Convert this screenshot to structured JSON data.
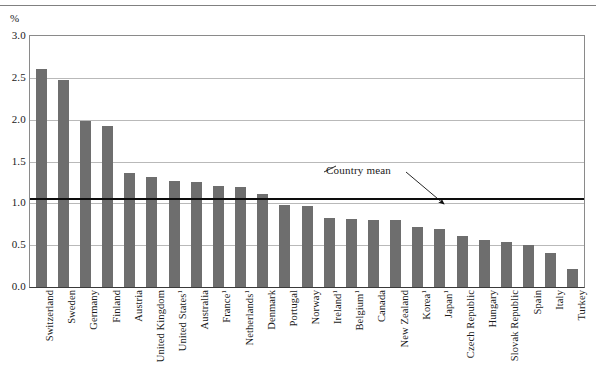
{
  "chart_data": {
    "type": "bar",
    "title": "",
    "subtitle": "",
    "unit_label": "%",
    "xlabel": "",
    "ylabel": "%",
    "ylim": [
      0.0,
      3.0
    ],
    "ytick_labels": [
      "3.0",
      "2.5",
      "2.0",
      "1.5",
      "1.0",
      "0.5",
      "0.0"
    ],
    "ytick_values": [
      3.0,
      2.5,
      2.0,
      1.5,
      1.0,
      0.5,
      0.0
    ],
    "grid": true,
    "legend": "none",
    "bar_color": "#6e6e6e",
    "mean_line_color": "#0d0d0d",
    "gridline_color": "#b9b9b9",
    "axis_color": "#8a8a8a",
    "categories": [
      "Switzerland",
      "Sweden",
      "Germany",
      "Finland",
      "Austria",
      "United Kingdom",
      "United States",
      "Australia",
      "France",
      "Netherlands",
      "Denmark",
      "Portugal",
      "Norway",
      "Ireland",
      "Belgium",
      "Canada",
      "New Zealand",
      "Korea",
      "Japan",
      "Czech Republic",
      "Hungary",
      "Slovak Republic",
      "Spain",
      "Italy",
      "Turkey"
    ],
    "category_footnotes": [
      "",
      "",
      "",
      "",
      "",
      "",
      "1",
      "",
      "1",
      "1",
      "",
      "",
      "",
      "1",
      "1",
      "",
      "",
      "1",
      "1",
      "",
      "",
      "",
      "",
      "",
      ""
    ],
    "values": [
      2.61,
      2.47,
      1.99,
      1.93,
      1.36,
      1.32,
      1.27,
      1.25,
      1.21,
      1.2,
      1.11,
      0.98,
      0.97,
      0.82,
      0.81,
      0.8,
      0.8,
      0.72,
      0.69,
      0.61,
      0.56,
      0.54,
      0.5,
      0.41,
      0.22
    ],
    "annotations": [
      {
        "text": "Country mean",
        "value": 1.05,
        "kind": "mean-line-arrow"
      }
    ],
    "mean_value": 1.05
  }
}
